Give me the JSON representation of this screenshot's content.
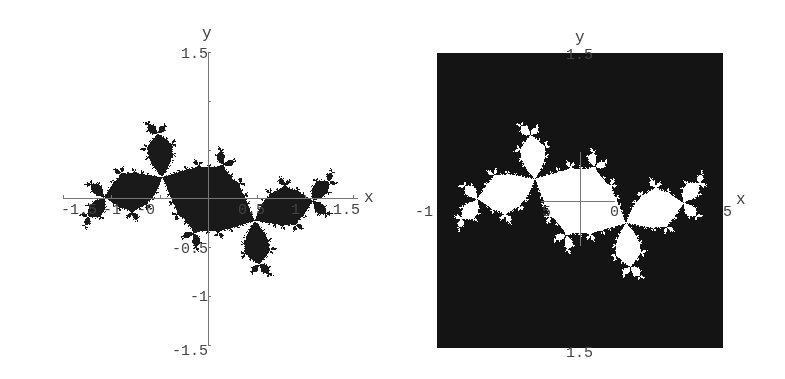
{
  "chart_data": [
    {
      "type": "heatmap",
      "title": "",
      "description": "Filled Julia set (points with bounded orbit) shown black on white background",
      "xlabel": "x",
      "ylabel": "y",
      "xlim": [
        -1.5,
        1.5
      ],
      "ylim": [
        -1.5,
        1.5
      ],
      "x_ticks": [
        "-1.5",
        "-1",
        "-0.5",
        "0.5",
        "1",
        "1.5"
      ],
      "y_ticks": [
        "1.5",
        "0.5",
        "-0.5",
        "-1",
        "-1.5"
      ],
      "grid": false,
      "set_color": "#1a1a1a",
      "background_color": "#ffffff",
      "julia_c": [
        -0.12,
        0.75
      ],
      "rotation_deg": -35
    },
    {
      "type": "heatmap",
      "title": "",
      "description": "Same Julia set with inverted colors: escaping region black, filled set white",
      "xlabel": "x",
      "ylabel": "y",
      "xlim": [
        -1.5,
        1.5
      ],
      "ylim": [
        -1.5,
        1.5
      ],
      "x_ticks": [
        "-1",
        ".5",
        "0",
        ".5"
      ],
      "y_ticks": [
        "1.5",
        "-1.5"
      ],
      "grid": false,
      "set_color": "#ffffff",
      "background_color": "#141414",
      "julia_c": [
        -0.12,
        0.75
      ],
      "rotation_deg": -35
    }
  ],
  "left": {
    "x_axis_label": "x",
    "y_axis_label": "y",
    "x_tick_labels": [
      {
        "text": "-1.5",
        "left": 61
      },
      {
        "text": "-1",
        "left": 103
      },
      {
        "text": "-0",
        "left": 137
      },
      {
        "text": "0.5",
        "left": 238
      },
      {
        "text": "1",
        "left": 291
      },
      {
        "text": "1.5",
        "left": 333
      }
    ],
    "y_tick_labels": [
      {
        "text": "1.5",
        "top": 47
      },
      {
        "text": "-0.5",
        "top": 242
      },
      {
        "text": "-1",
        "top": 290
      },
      {
        "text": "-1.5",
        "top": 344
      }
    ]
  },
  "right": {
    "x_axis_label": "x",
    "y_axis_label": "y",
    "x_tick_labels": [
      {
        "text": "-1",
        "left": 415
      },
      {
        "text": "5",
        "left": 542
      },
      {
        "text": "0",
        "left": 610
      },
      {
        "text": "5",
        "left": 723
      }
    ],
    "y_tick_labels": [
      {
        "text": "1.5",
        "top": 48
      },
      {
        "text": "1.5",
        "top": 346
      }
    ]
  }
}
